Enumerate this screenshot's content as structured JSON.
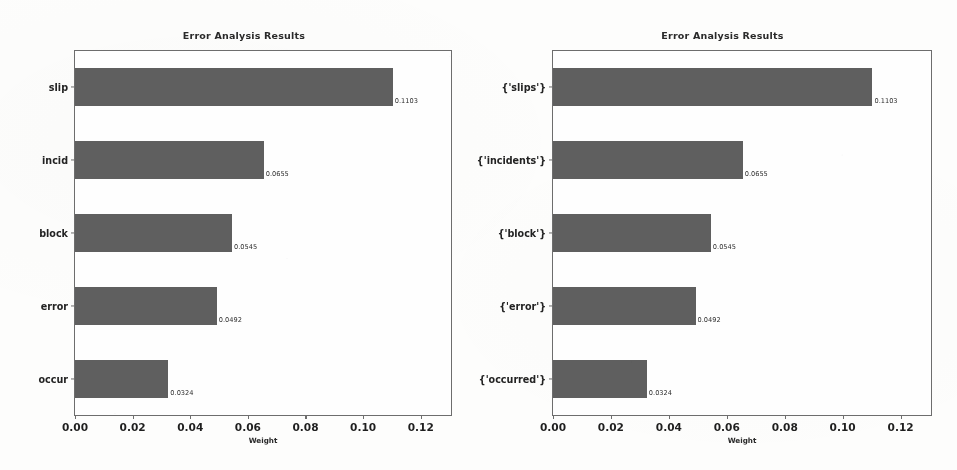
{
  "chart_data": [
    {
      "type": "bar",
      "orientation": "horizontal",
      "title": "Error Analysis Results",
      "xlabel": "Weight",
      "ylabel": "",
      "categories": [
        "slip",
        "incid",
        "block",
        "error",
        "occur"
      ],
      "values": [
        0.1103,
        0.0655,
        0.0545,
        0.0492,
        0.0324
      ],
      "value_labels": [
        "0.1103",
        "0.0655",
        "0.0545",
        "0.0492",
        "0.0324"
      ],
      "xlim": [
        0.0,
        0.1305
      ],
      "xticks": [
        0.0,
        0.02,
        0.04,
        0.06,
        0.08,
        0.1,
        0.12
      ],
      "xtick_labels": [
        "0.00",
        "0.02",
        "0.04",
        "0.06",
        "0.08",
        "0.10",
        "0.12"
      ],
      "grid": false,
      "legend": false,
      "bar_color": "#5f5f5f"
    },
    {
      "type": "bar",
      "orientation": "horizontal",
      "title": "Error Analysis Results",
      "xlabel": "Weight",
      "ylabel": "",
      "categories": [
        "{'slips'}",
        "{'incidents'}",
        "{'block'}",
        "{'error'}",
        "{'occurred'}"
      ],
      "values": [
        0.1103,
        0.0655,
        0.0545,
        0.0492,
        0.0324
      ],
      "value_labels": [
        "0.1103",
        "0.0655",
        "0.0545",
        "0.0492",
        "0.0324"
      ],
      "xlim": [
        0.0,
        0.1305
      ],
      "xticks": [
        0.0,
        0.02,
        0.04,
        0.06,
        0.08,
        0.1,
        0.12
      ],
      "xtick_labels": [
        "0.00",
        "0.02",
        "0.04",
        "0.06",
        "0.08",
        "0.10",
        "0.12"
      ],
      "grid": false,
      "legend": false,
      "bar_color": "#5f5f5f"
    }
  ]
}
